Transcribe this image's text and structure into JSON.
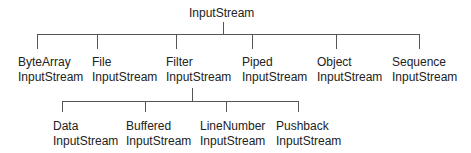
{
  "diagram": {
    "root": {
      "label": "InputStream"
    },
    "level1": [
      {
        "line1": "ByteArray",
        "line2": "InputStream"
      },
      {
        "line1": "File",
        "line2": "InputStream"
      },
      {
        "line1": "Filter",
        "line2": "InputStream"
      },
      {
        "line1": "Piped",
        "line2": "InputStream"
      },
      {
        "line1": "Object",
        "line2": "InputStream"
      },
      {
        "line1": "Sequence",
        "line2": "InputStream"
      }
    ],
    "level2": [
      {
        "line1": "Data",
        "line2": "InputStream"
      },
      {
        "line1": "Buffered",
        "line2": "InputStream"
      },
      {
        "line1": "LineNumber",
        "line2": "InputStream"
      },
      {
        "line1": "Pushback",
        "line2": "InputStream"
      }
    ]
  }
}
